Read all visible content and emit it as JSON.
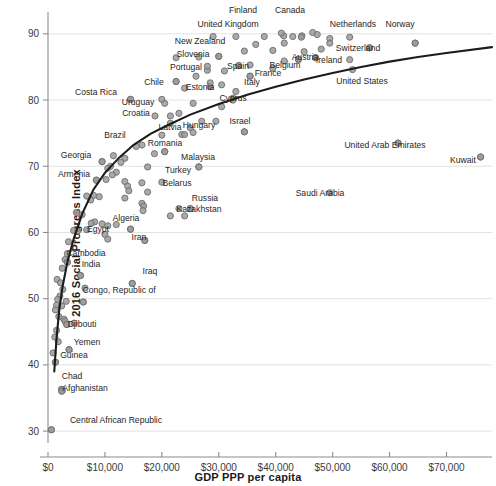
{
  "chart_data": {
    "type": "scatter",
    "title": "",
    "xlabel": "GDP PPP per capita",
    "ylabel": "2016 Social Progress Index",
    "xlim": [
      0,
      78000
    ],
    "ylim": [
      28,
      93
    ],
    "xticks": [
      0,
      10000,
      20000,
      30000,
      40000,
      50000,
      60000,
      70000
    ],
    "xticklabels": [
      "$0",
      "$10,000",
      "$20,000",
      "$30,000",
      "$40,000",
      "$50,000",
      "$60,000",
      "$70,000"
    ],
    "yticks": [
      30,
      40,
      50,
      60,
      70,
      80,
      90
    ],
    "yticklabels": [
      "30",
      "40",
      "50",
      "60",
      "70",
      "80",
      "90"
    ],
    "grid": "horizontal",
    "legend": "none",
    "series_name": "Countries",
    "trendline": {
      "kind": "logarithmic",
      "points": [
        [
          1100,
          39.0
        ],
        [
          1500,
          44.0
        ],
        [
          2000,
          48.5
        ],
        [
          2600,
          52.0
        ],
        [
          3400,
          55.5
        ],
        [
          4500,
          59.0
        ],
        [
          6000,
          62.8
        ],
        [
          8000,
          66.5
        ],
        [
          10000,
          69.0
        ],
        [
          12500,
          71.3
        ],
        [
          15000,
          73.2
        ],
        [
          18000,
          74.9
        ],
        [
          21000,
          76.2
        ],
        [
          25000,
          77.8
        ],
        [
          30000,
          79.4
        ],
        [
          35000,
          80.8
        ],
        [
          40000,
          82.0
        ],
        [
          45000,
          83.1
        ],
        [
          50000,
          84.1
        ],
        [
          55000,
          85.0
        ],
        [
          60000,
          85.8
        ],
        [
          65000,
          86.5
        ],
        [
          70000,
          87.1
        ],
        [
          78000,
          88.0
        ]
      ]
    },
    "points": [
      {
        "label": "Finland",
        "x": 41000,
        "y": 90.1,
        "lx": 243,
        "ly": 13,
        "anchor": "middle"
      },
      {
        "label": "Canada",
        "x": 44500,
        "y": 89.5,
        "lx": 290,
        "ly": 13,
        "anchor": "middle"
      },
      {
        "label": "United Kingdom",
        "x": 41500,
        "y": 88.6,
        "lx": 228,
        "ly": 27,
        "anchor": "middle"
      },
      {
        "label": "Netherlands",
        "x": 49500,
        "y": 88.6,
        "lx": 353,
        "ly": 27,
        "anchor": "middle"
      },
      {
        "label": "Norway",
        "x": 64500,
        "y": 88.6,
        "lx": 400,
        "ly": 27,
        "anchor": "middle"
      },
      {
        "label": "New Zealand",
        "x": 36500,
        "y": 88.4,
        "lx": 200,
        "ly": 44,
        "anchor": "middle"
      },
      {
        "label": "Switzerland",
        "x": 56500,
        "y": 87.9,
        "lx": 358,
        "ly": 51,
        "anchor": "middle"
      },
      {
        "label": "Slovenia",
        "x": 30000,
        "y": 86.6,
        "lx": 193,
        "ly": 57,
        "anchor": "middle"
      },
      {
        "label": "Austria",
        "x": 47000,
        "y": 86.4,
        "lx": 305,
        "ly": 60,
        "anchor": "middle"
      },
      {
        "label": "Belgium",
        "x": 44000,
        "y": 86.2,
        "lx": 285,
        "ly": 68,
        "anchor": "middle"
      },
      {
        "label": "Ireland",
        "x": 53000,
        "y": 86.1,
        "lx": 329,
        "ly": 63,
        "anchor": "middle"
      },
      {
        "label": "Portugal",
        "x": 28000,
        "y": 85.1,
        "lx": 186,
        "ly": 70,
        "anchor": "middle"
      },
      {
        "label": "Spain",
        "x": 33500,
        "y": 85.2,
        "lx": 238,
        "ly": 69,
        "anchor": "middle"
      },
      {
        "label": "France",
        "x": 39500,
        "y": 84.8,
        "lx": 268,
        "ly": 76,
        "anchor": "middle"
      },
      {
        "label": "Italy",
        "x": 35500,
        "y": 83.6,
        "lx": 252,
        "ly": 85,
        "anchor": "middle"
      },
      {
        "label": "Chile",
        "x": 22500,
        "y": 82.8,
        "lx": 154,
        "ly": 85,
        "anchor": "middle"
      },
      {
        "label": "Estonia",
        "x": 28500,
        "y": 82.6,
        "lx": 200,
        "ly": 90,
        "anchor": "middle"
      },
      {
        "label": "United States",
        "x": 53500,
        "y": 84.6,
        "lx": 362,
        "ly": 84,
        "anchor": "middle"
      },
      {
        "label": "Costa Rica",
        "x": 14500,
        "y": 80.1,
        "lx": 96,
        "ly": 95,
        "anchor": "middle"
      },
      {
        "label": "Cyprus",
        "x": 32500,
        "y": 80.0,
        "lx": 233,
        "ly": 101,
        "anchor": "middle"
      },
      {
        "label": "Uruguay",
        "x": 20500,
        "y": 79.5,
        "lx": 138,
        "ly": 105,
        "anchor": "middle"
      },
      {
        "label": "Croatia",
        "x": 21500,
        "y": 77.6,
        "lx": 136,
        "ly": 116,
        "anchor": "middle"
      },
      {
        "label": "Israel",
        "x": 34500,
        "y": 75.2,
        "lx": 240,
        "ly": 124,
        "anchor": "middle"
      },
      {
        "label": "Hungary",
        "x": 25500,
        "y": 75.1,
        "lx": 199,
        "ly": 128,
        "anchor": "middle"
      },
      {
        "label": "Latvia",
        "x": 24000,
        "y": 74.8,
        "lx": 170,
        "ly": 130,
        "anchor": "middle"
      },
      {
        "label": "Brazil",
        "x": 15500,
        "y": 73.0,
        "lx": 115,
        "ly": 138,
        "anchor": "middle"
      },
      {
        "label": "Romania",
        "x": 20500,
        "y": 72.2,
        "lx": 165,
        "ly": 146,
        "anchor": "middle"
      },
      {
        "label": "United Arab Emirates",
        "x": 61500,
        "y": 73.5,
        "lx": 385,
        "ly": 148,
        "anchor": "middle"
      },
      {
        "label": "Kuwait",
        "x": 76000,
        "y": 71.4,
        "lx": 463,
        "ly": 163,
        "anchor": "middle"
      },
      {
        "label": "Georgia",
        "x": 9500,
        "y": 70.7,
        "lx": 76,
        "ly": 158,
        "anchor": "middle"
      },
      {
        "label": "Malaysia",
        "x": 26500,
        "y": 69.9,
        "lx": 198,
        "ly": 160,
        "anchor": "middle"
      },
      {
        "label": "Armenia",
        "x": 8500,
        "y": 67.9,
        "lx": 74,
        "ly": 177,
        "anchor": "middle"
      },
      {
        "label": "Turkey",
        "x": 20000,
        "y": 67.6,
        "lx": 178,
        "ly": 173,
        "anchor": "middle"
      },
      {
        "label": "Belarus",
        "x": 17500,
        "y": 66.1,
        "lx": 177,
        "ly": 186,
        "anchor": "middle"
      },
      {
        "label": "Russia",
        "x": 25000,
        "y": 63.6,
        "lx": 205,
        "ly": 201,
        "anchor": "middle"
      },
      {
        "label": "Kazakhstan",
        "x": 24000,
        "y": 62.5,
        "lx": 199,
        "ly": 212,
        "anchor": "middle"
      },
      {
        "label": "Saudi Arabia",
        "x": 49500,
        "y": 66.0,
        "lx": 320,
        "ly": 196,
        "anchor": "middle"
      },
      {
        "label": "Algeria",
        "x": 14500,
        "y": 60.5,
        "lx": 126,
        "ly": 221,
        "anchor": "middle"
      },
      {
        "label": "Egypt",
        "x": 10500,
        "y": 59.0,
        "lx": 98,
        "ly": 232,
        "anchor": "middle"
      },
      {
        "label": "Iran",
        "x": 17000,
        "y": 58.8,
        "lx": 139,
        "ly": 240,
        "anchor": "middle"
      },
      {
        "label": "Cambodia",
        "x": 3400,
        "y": 55.5,
        "lx": 86,
        "ly": 256,
        "anchor": "middle"
      },
      {
        "label": "India",
        "x": 5700,
        "y": 53.5,
        "lx": 91,
        "ly": 267,
        "anchor": "middle"
      },
      {
        "label": "Iraq",
        "x": 14800,
        "y": 52.3,
        "lx": 150,
        "ly": 274,
        "anchor": "middle"
      },
      {
        "label": "Congo, Republic of",
        "x": 6200,
        "y": 49.5,
        "lx": 119,
        "ly": 293,
        "anchor": "middle"
      },
      {
        "label": "Djibouti",
        "x": 3300,
        "y": 46.1,
        "lx": 82,
        "ly": 327,
        "anchor": "middle"
      },
      {
        "label": "Yemen",
        "x": 3700,
        "y": 42.3,
        "lx": 87,
        "ly": 345,
        "anchor": "middle"
      },
      {
        "label": "Guinea",
        "x": 1300,
        "y": 40.4,
        "lx": 74,
        "ly": 358,
        "anchor": "middle"
      },
      {
        "label": "Chad",
        "x": 2400,
        "y": 36.3,
        "lx": 72,
        "ly": 379,
        "anchor": "middle"
      },
      {
        "label": "Afghanistan",
        "x": 2400,
        "y": 36.0,
        "lx": 85,
        "ly": 391,
        "anchor": "middle"
      },
      {
        "label": "Central African Republic",
        "x": 600,
        "y": 30.2,
        "lx": 116,
        "ly": 423,
        "anchor": "middle"
      }
    ],
    "unlabeled_points": [
      [
        46500,
        90.2
      ],
      [
        47300,
        89.9
      ],
      [
        44600,
        89.7
      ],
      [
        43000,
        89.6
      ],
      [
        41400,
        89.7
      ],
      [
        38000,
        89.6
      ],
      [
        33000,
        89.6
      ],
      [
        29000,
        89.6
      ],
      [
        49500,
        89.3
      ],
      [
        53000,
        89.5
      ],
      [
        64500,
        88.6
      ],
      [
        56500,
        87.9
      ],
      [
        48000,
        87.7
      ],
      [
        45000,
        87.3
      ],
      [
        39500,
        87.5
      ],
      [
        34500,
        87.4
      ],
      [
        30000,
        86.6
      ],
      [
        26500,
        86.5
      ],
      [
        22500,
        86.4
      ],
      [
        47000,
        86.4
      ],
      [
        44000,
        86.1
      ],
      [
        41500,
        85.9
      ],
      [
        35500,
        85.3
      ],
      [
        33500,
        85.2
      ],
      [
        28000,
        84.5
      ],
      [
        31000,
        84.4
      ],
      [
        26000,
        83.6
      ],
      [
        35500,
        83.6
      ],
      [
        22500,
        82.8
      ],
      [
        30500,
        82.3
      ],
      [
        28500,
        82.0
      ],
      [
        24000,
        81.8
      ],
      [
        33000,
        81.3
      ],
      [
        32500,
        80.3
      ],
      [
        20000,
        80.1
      ],
      [
        14500,
        80.1
      ],
      [
        25500,
        79.5
      ],
      [
        30500,
        79.0
      ],
      [
        23000,
        78.0
      ],
      [
        18800,
        77.6
      ],
      [
        21500,
        76.5
      ],
      [
        29500,
        76.8
      ],
      [
        27000,
        76.8
      ],
      [
        25000,
        75.8
      ],
      [
        34500,
        75.2
      ],
      [
        23500,
        74.8
      ],
      [
        20000,
        74.7
      ],
      [
        16500,
        73.2
      ],
      [
        20500,
        72.2
      ],
      [
        18700,
        71.9
      ],
      [
        11500,
        71.6
      ],
      [
        13500,
        71.2
      ],
      [
        12800,
        70.6
      ],
      [
        11000,
        70.0
      ],
      [
        10500,
        69.7
      ],
      [
        17500,
        69.9
      ],
      [
        26500,
        69.9
      ],
      [
        61500,
        73.5
      ],
      [
        76000,
        71.4
      ],
      [
        9500,
        70.7
      ],
      [
        12000,
        69.1
      ],
      [
        11300,
        68.7
      ],
      [
        10200,
        68.0
      ],
      [
        13500,
        67.7
      ],
      [
        16500,
        67.5
      ],
      [
        8500,
        67.9
      ],
      [
        14000,
        67.0
      ],
      [
        14200,
        66.3
      ],
      [
        8000,
        65.6
      ],
      [
        9000,
        65.4
      ],
      [
        13500,
        65.2
      ],
      [
        6800,
        65.5
      ],
      [
        7500,
        64.9
      ],
      [
        16500,
        64.4
      ],
      [
        16800,
        64.0
      ],
      [
        23000,
        63.6
      ],
      [
        25000,
        63.6
      ],
      [
        16700,
        63.3
      ],
      [
        21500,
        62.5
      ],
      [
        6000,
        62.7
      ],
      [
        5000,
        63.0
      ],
      [
        14500,
        60.5
      ],
      [
        12000,
        61.2
      ],
      [
        10500,
        61.0
      ],
      [
        9500,
        61.3
      ],
      [
        8200,
        61.6
      ],
      [
        7600,
        61.4
      ],
      [
        6800,
        60.4
      ],
      [
        5200,
        60.2
      ],
      [
        4500,
        60.3
      ],
      [
        10000,
        59.7
      ],
      [
        17000,
        58.8
      ],
      [
        3600,
        58.6
      ],
      [
        3400,
        56.8
      ],
      [
        3000,
        55.9
      ],
      [
        3400,
        55.5
      ],
      [
        2500,
        54.6
      ],
      [
        5700,
        53.5
      ],
      [
        1600,
        52.9
      ],
      [
        2200,
        52.4
      ],
      [
        14800,
        52.3
      ],
      [
        6500,
        51.6
      ],
      [
        2600,
        51.4
      ],
      [
        2100,
        50.4
      ],
      [
        1700,
        49.9
      ],
      [
        3200,
        49.6
      ],
      [
        6200,
        49.5
      ],
      [
        1500,
        49.0
      ],
      [
        2400,
        48.9
      ],
      [
        1300,
        48.3
      ],
      [
        1900,
        47.3
      ],
      [
        2800,
        46.9
      ],
      [
        3000,
        46.6
      ],
      [
        4600,
        46.3
      ],
      [
        3300,
        46.1
      ],
      [
        1500,
        45.2
      ],
      [
        1200,
        44.2
      ],
      [
        1800,
        43.5
      ],
      [
        900,
        41.8
      ],
      [
        3700,
        42.3
      ],
      [
        1300,
        40.4
      ],
      [
        2400,
        36.3
      ],
      [
        2500,
        36.1
      ],
      [
        600,
        30.2
      ]
    ]
  },
  "axes": {
    "x_title": "GDP PPP per capita",
    "y_title": "2016 Social Progress Index"
  },
  "style": {
    "point_fill": "#9b9b9b",
    "point_stroke": "#6e6e6e",
    "trend_color": "#1c1c1c",
    "grid_color": "#e2e2e2",
    "axis_color": "#8c8c8c",
    "text_color": "#262626",
    "background": "#ffffff"
  }
}
